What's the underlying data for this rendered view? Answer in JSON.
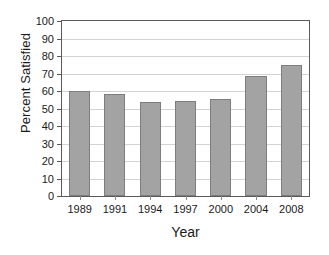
{
  "chart_data": {
    "type": "bar",
    "title": "",
    "xlabel": "Year",
    "ylabel": "Percent Satisfied",
    "categories": [
      "1989",
      "1991",
      "1994",
      "1997",
      "2000",
      "2004",
      "2008"
    ],
    "values": [
      59.8,
      58.4,
      53.7,
      54.3,
      55.2,
      68.5,
      75.0
    ],
    "ylim": [
      0,
      100
    ],
    "yticks": [
      0,
      10,
      20,
      30,
      40,
      50,
      60,
      70,
      80,
      90,
      100
    ],
    "ytick_labels": [
      "0",
      "10",
      "20",
      "30",
      "40",
      "50",
      "60",
      "70",
      "80",
      "90",
      "100"
    ],
    "grid": "horizontal",
    "legend": "none",
    "series": [
      {
        "name": "Percent Satisfied",
        "values": [
          59.8,
          58.4,
          53.7,
          54.3,
          55.2,
          68.5,
          75.0
        ]
      }
    ],
    "colors": {
      "bar_fill": "#a3a3a3",
      "bar_edge": "#7d7d7d",
      "gridline": "#d3d3d3",
      "axis": "#5a5a5a",
      "background": "#ffffff",
      "text": "#1a1a1a"
    }
  }
}
